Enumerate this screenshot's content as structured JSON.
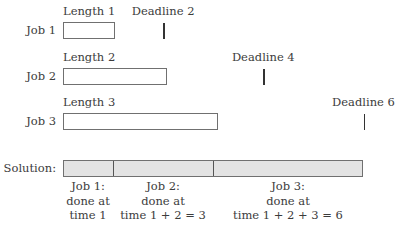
{
  "diagram": {
    "jobs": [
      {
        "row_label": "Job 1",
        "length_label": "Length 1",
        "length": 1,
        "deadline_label": "Deadline 2",
        "deadline": 2
      },
      {
        "row_label": "Job 2",
        "length_label": "Length 2",
        "length": 2,
        "deadline_label": "Deadline 4",
        "deadline": 4
      },
      {
        "row_label": "Job 3",
        "length_label": "Length 3",
        "length": 3,
        "deadline_label": "Deadline 6",
        "deadline": 6
      }
    ],
    "solution": {
      "label": "Solution:",
      "segments": [
        {
          "job": 1,
          "start": 0,
          "end": 1,
          "caption": [
            "Job 1:",
            "done at",
            "time 1"
          ]
        },
        {
          "job": 2,
          "start": 1,
          "end": 3,
          "caption": [
            "Job 2:",
            "done at",
            "time 1 + 2 = 3"
          ]
        },
        {
          "job": 3,
          "start": 3,
          "end": 6,
          "caption": [
            "Job 3:",
            "done at",
            "time 1 + 2 + 3 = 6"
          ]
        }
      ]
    },
    "colors": {
      "solution_fill": "#e3e3e3",
      "box_border": "#707070",
      "text": "#3c3c3c"
    }
  }
}
